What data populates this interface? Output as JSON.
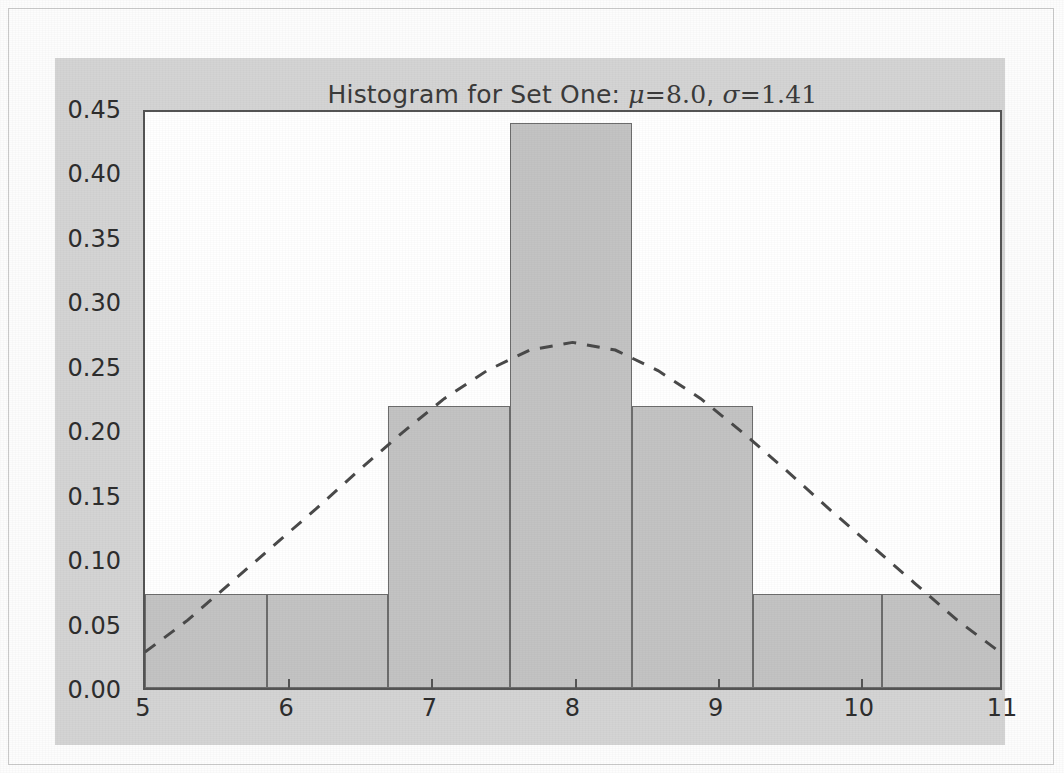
{
  "chart_data": {
    "type": "bar",
    "title_parts": {
      "prefix": "Histogram for Set One: ",
      "mu_symbol": "μ",
      "equals_1": "=",
      "mu_value": "8.0",
      "separator": ", ",
      "sigma_symbol": "σ",
      "equals_2": "=",
      "sigma_value": "1.41"
    },
    "xlabel": "",
    "ylabel": "",
    "xlim": [
      5,
      11
    ],
    "ylim": [
      0.0,
      0.45
    ],
    "grid": false,
    "legend": null,
    "xtick_labels": [
      "5",
      "6",
      "7",
      "8",
      "9",
      "10",
      "11"
    ],
    "xticks": [
      5,
      6,
      7,
      8,
      9,
      10,
      11
    ],
    "ytick_labels": [
      "0.00",
      "0.05",
      "0.10",
      "0.15",
      "0.20",
      "0.25",
      "0.30",
      "0.35",
      "0.40",
      "0.45"
    ],
    "yticks": [
      0.0,
      0.05,
      0.1,
      0.15,
      0.2,
      0.25,
      0.3,
      0.35,
      0.4,
      0.45
    ],
    "bin_edges": [
      5.0,
      5.85,
      6.7,
      7.55,
      8.4,
      9.25,
      11.0
    ],
    "bars": [
      {
        "left": 5.0,
        "right": 5.85,
        "value": 0.073
      },
      {
        "left": 5.85,
        "right": 6.7,
        "value": 0.073
      },
      {
        "left": 6.7,
        "right": 7.55,
        "value": 0.219
      },
      {
        "left": 7.55,
        "right": 8.4,
        "value": 0.438
      },
      {
        "left": 8.4,
        "right": 9.25,
        "value": 0.219
      },
      {
        "left": 9.25,
        "right": 10.15,
        "value": 0.073
      },
      {
        "left": 10.15,
        "right": 11.0,
        "value": 0.073
      }
    ],
    "values": [
      0.073,
      0.073,
      0.219,
      0.438,
      0.219,
      0.073,
      0.073
    ],
    "categories": [
      "5.0-5.85",
      "5.85-6.7",
      "6.7-7.55",
      "7.55-8.4",
      "8.4-9.25",
      "9.25-10.15",
      "10.15-11.0"
    ],
    "overlay": {
      "name": "normal-pdf-fit",
      "style": "dashed",
      "mu": 8.0,
      "sigma": 1.41,
      "peak_value": 0.27,
      "endpoint_left_value": 0.028,
      "endpoint_right_value": 0.028,
      "points": [
        {
          "x": 5.0,
          "y": 0.028
        },
        {
          "x": 5.3,
          "y": 0.053
        },
        {
          "x": 5.6,
          "y": 0.082
        },
        {
          "x": 5.9,
          "y": 0.111
        },
        {
          "x": 6.2,
          "y": 0.14
        },
        {
          "x": 6.5,
          "y": 0.17
        },
        {
          "x": 6.8,
          "y": 0.199
        },
        {
          "x": 7.1,
          "y": 0.226
        },
        {
          "x": 7.4,
          "y": 0.248
        },
        {
          "x": 7.7,
          "y": 0.264
        },
        {
          "x": 8.0,
          "y": 0.27
        },
        {
          "x": 8.3,
          "y": 0.264
        },
        {
          "x": 8.6,
          "y": 0.248
        },
        {
          "x": 8.9,
          "y": 0.226
        },
        {
          "x": 9.2,
          "y": 0.199
        },
        {
          "x": 9.5,
          "y": 0.17
        },
        {
          "x": 9.8,
          "y": 0.14
        },
        {
          "x": 10.1,
          "y": 0.111
        },
        {
          "x": 10.4,
          "y": 0.082
        },
        {
          "x": 10.7,
          "y": 0.053
        },
        {
          "x": 11.0,
          "y": 0.028
        }
      ]
    },
    "colors": {
      "bar_fill": "#c3c3c3",
      "bar_edge": "#6d6d6d",
      "curve": "#4a4a4a",
      "axes_edge": "#555555",
      "figure_background": "#d4d4d4",
      "axes_background": "#ffffff",
      "tick_label": "#2e2e2e",
      "title": "#3b3b3b",
      "page_background": "#fdfdfd",
      "page_border": "#c9c9c9"
    }
  }
}
